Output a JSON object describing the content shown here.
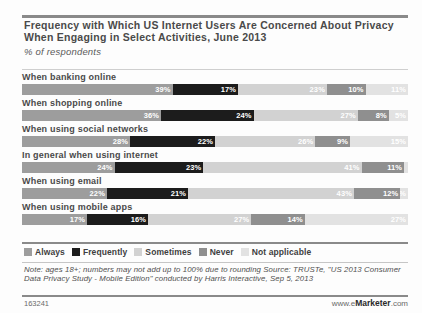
{
  "header": {
    "title": "Frequency with Which US Internet Users Are Concerned About Privacy When Engaging in Select Activities, June 2013",
    "subtitle": "% of respondents"
  },
  "footer": {
    "note": "Note: ages 18+; numbers may not add up to 100% due to rounding Source: TRUSTe, \"US 2013 Consumer Data Privacy Study - Mobile Edition\" conducted by Harris Interactive, Sep 5, 2013",
    "chart_id": "163241",
    "brand_prefix": "www.e",
    "brand_name": "Marketer",
    "brand_suffix": ".com"
  },
  "chart_data": {
    "type": "bar",
    "orientation": "horizontal",
    "stacked": true,
    "stacked_percent": true,
    "title": "Frequency with Which US Internet Users Are Concerned About Privacy When Engaging in Select Activities, June 2013",
    "subtitle": "% of respondents",
    "xlabel": "",
    "ylabel": "",
    "xlim": [
      0,
      100
    ],
    "grid": false,
    "legend_position": "bottom",
    "categories": [
      "When banking online",
      "When shopping online",
      "When using social networks",
      "In general when using internet",
      "When using email",
      "When using mobile apps"
    ],
    "series": [
      {
        "name": "Always",
        "color": "#9d9d9d",
        "values": [
          39,
          36,
          28,
          24,
          22,
          17
        ]
      },
      {
        "name": "Frequently",
        "color": "#1c1c1c",
        "values": [
          17,
          24,
          22,
          23,
          21,
          16
        ]
      },
      {
        "name": "Sometimes",
        "color": "#d2d2d2",
        "values": [
          23,
          27,
          26,
          41,
          43,
          27
        ]
      },
      {
        "name": "Never",
        "color": "#8f8f8f",
        "values": [
          10,
          8,
          9,
          11,
          12,
          14
        ]
      },
      {
        "name": "Not applicable",
        "color": "#e2e2e2",
        "values": [
          11,
          5,
          15,
          1,
          2,
          27
        ]
      }
    ],
    "data_labels": [
      {
        "category": "When banking online",
        "labels": [
          "39%",
          "17%",
          "23%",
          "10%",
          "11%"
        ]
      },
      {
        "category": "When shopping online",
        "labels": [
          "36%",
          "24%",
          "27%",
          "8%",
          "5%"
        ]
      },
      {
        "category": "When using social networks",
        "labels": [
          "28%",
          "22%",
          "26%",
          "9%",
          "15%"
        ]
      },
      {
        "category": "In general when using internet",
        "labels": [
          "24%",
          "23%",
          "41%",
          "11%",
          ""
        ]
      },
      {
        "category": "When using email",
        "labels": [
          "22%",
          "21%",
          "43%",
          "12%",
          "2%"
        ]
      },
      {
        "category": "When using mobile apps",
        "labels": [
          "17%",
          "16%",
          "27%",
          "14%",
          "27%"
        ]
      }
    ]
  }
}
